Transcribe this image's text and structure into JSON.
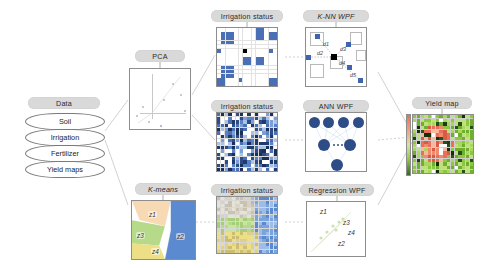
{
  "diagram": {
    "title_nodes": {
      "data": "Data",
      "pca": "PCA",
      "kmeans": "K-means",
      "irrigation_top": "Irrigation status",
      "irrigation_mid": "Irrigation status",
      "irrigation_bottom": "Irrigation status",
      "knn": "K-NN WPF",
      "ann": "ANN WPF",
      "regression": "Regression WPF",
      "yield": "Yield map"
    },
    "data_stack": [
      {
        "label": "Soil"
      },
      {
        "label": "Irrigation"
      },
      {
        "label": "Fertilizer"
      },
      {
        "label": "Yield maps"
      }
    ],
    "kmeans_zones": [
      {
        "id": "z1",
        "label": "z1",
        "color": "#f7d9b4"
      },
      {
        "id": "z2",
        "label": "z2",
        "color": "#5b8ad1"
      },
      {
        "id": "z3",
        "label": "z3",
        "color": "#b7d98a"
      },
      {
        "id": "z4",
        "label": "z4",
        "color": "#ecdf85"
      }
    ],
    "regression_zones": [
      {
        "label": "z1"
      },
      {
        "label": "z3"
      },
      {
        "label": "z4"
      },
      {
        "label": "z2"
      }
    ],
    "knn_distances": [
      {
        "label": "d1"
      },
      {
        "label": "d2"
      },
      {
        "label": "d3"
      },
      {
        "label": "d4"
      },
      {
        "label": "d5"
      }
    ],
    "colors": {
      "pill": "#d9d9d9",
      "blue_cell": "#4a6fb5",
      "blue_dark": "#2e4d86",
      "yield_red": "#e8705a",
      "yield_green": "#8dc63f",
      "yield_dark": "#1d3b14",
      "edge": "#bdbdbd"
    },
    "ann_layers": {
      "input_nodes": 4,
      "hidden_nodes": 2,
      "output_nodes": 1
    }
  }
}
